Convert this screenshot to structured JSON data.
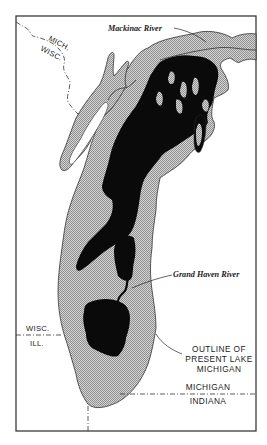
{
  "map": {
    "subject": "Ancient glacial lake stages within outline of present Lake Michigan",
    "colors": {
      "background": "#ffffff",
      "frame": "#2a2a2a",
      "present_lake_fill": "#cfcfcf",
      "present_lake_stipple": "#9a9a9a",
      "ancient_lake_fill": "#0a0a0a",
      "boundary_line": "#333333"
    },
    "labels": {
      "mackinac_river": "Mackinac River",
      "grand_haven_river": "Grand Haven River",
      "outline_line1": "OUTLINE OF",
      "outline_line2": "PRESENT LAKE",
      "outline_line3": "MICHIGAN",
      "mich_north": "MICH.",
      "wisc_north": "WISC.",
      "wisc_south": "WISC.",
      "ill": "ILL.",
      "michigan_south": "MICHIGAN",
      "indiana": "INDIANA"
    },
    "legend": {
      "stippled_area": "Present Lake Michigan",
      "black_area": "Ancient lake"
    }
  }
}
